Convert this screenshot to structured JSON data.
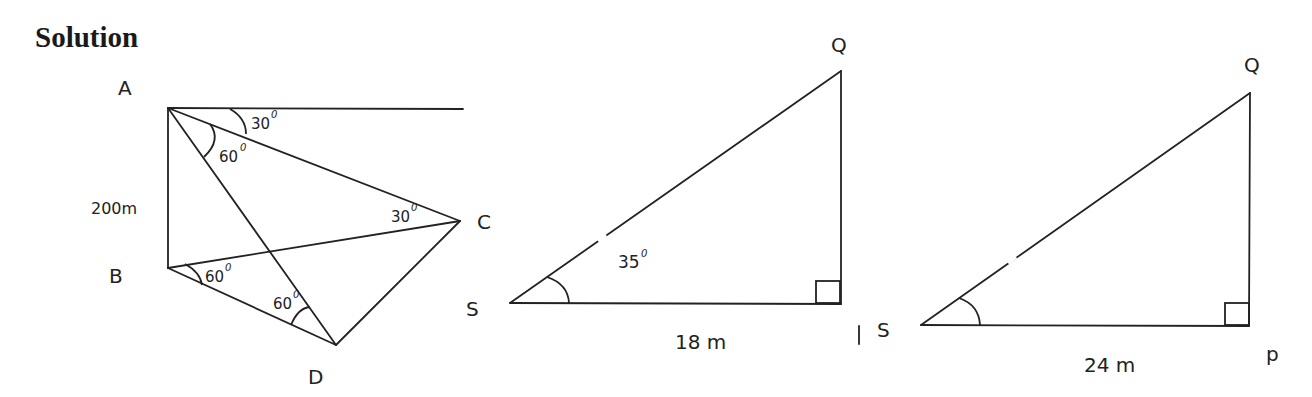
{
  "heading": "Solution",
  "figure1": {
    "vertices": {
      "A": "A",
      "B": "B",
      "C": "C",
      "D": "D"
    },
    "side_label_AB": "200m",
    "angles": {
      "elevation_A_C": "30",
      "angle_at_A": "60",
      "angle_at_C": "30",
      "angle_at_B": "60",
      "angle_at_D": "60"
    },
    "degree_symbol": "0"
  },
  "figure2": {
    "vertices": {
      "Q": "Q",
      "S": "S"
    },
    "angle_at_S": "35",
    "base_label": "18 m",
    "degree_symbol": "0"
  },
  "figure3": {
    "vertices": {
      "Q": "Q",
      "S": "S",
      "P": "p"
    },
    "base_label": "24 m"
  }
}
